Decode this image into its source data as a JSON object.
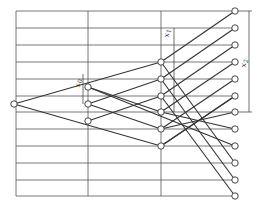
{
  "diagram": {
    "title": "",
    "stroke_color": "#333333",
    "grid_color": "#555555",
    "node_fill": "#ffffff",
    "labels": {
      "x0": "x",
      "x0_sub": "0",
      "x1": "x",
      "x1_sub": "1",
      "x2": "x",
      "x2_sub": "2"
    },
    "grid": {
      "left": 16,
      "top": 11,
      "right": 235,
      "bottom": 196,
      "vertical_lines_x": [
        16,
        88,
        161
      ],
      "horizontal_lines_y": [
        11,
        28,
        45,
        62,
        79,
        96,
        112,
        129,
        146,
        163,
        180,
        196
      ]
    },
    "columns": [
      {
        "name": "column-0",
        "x": 14,
        "nodes_y": [
          104
        ]
      },
      {
        "name": "column-1",
        "x": 88,
        "nodes_y": [
          87,
          104,
          121
        ]
      },
      {
        "name": "column-2",
        "x": 161,
        "nodes_y": [
          62,
          79,
          96,
          112,
          129,
          146
        ]
      },
      {
        "name": "column-3",
        "x": 235,
        "nodes_y": [
          11,
          28,
          45,
          62,
          79,
          96,
          112,
          129,
          146,
          163,
          180,
          196
        ]
      }
    ],
    "edges": [
      [
        [
          14,
          104
        ],
        [
          161,
          62
        ]
      ],
      [
        [
          14,
          104
        ],
        [
          161,
          146
        ]
      ],
      [
        [
          88,
          87
        ],
        [
          161,
          112
        ]
      ],
      [
        [
          88,
          87
        ],
        [
          235,
          146
        ]
      ],
      [
        [
          88,
          104
        ],
        [
          161,
          79
        ]
      ],
      [
        [
          88,
          121
        ],
        [
          161,
          96
        ]
      ],
      [
        [
          88,
          104
        ],
        [
          161,
          129
        ]
      ],
      [
        [
          161,
          62
        ],
        [
          235,
          11
        ]
      ],
      [
        [
          161,
          79
        ],
        [
          235,
          28
        ]
      ],
      [
        [
          161,
          96
        ],
        [
          235,
          45
        ]
      ],
      [
        [
          161,
          112
        ],
        [
          235,
          62
        ]
      ],
      [
        [
          161,
          129
        ],
        [
          235,
          79
        ]
      ],
      [
        [
          161,
          146
        ],
        [
          235,
          96
        ]
      ],
      [
        [
          161,
          62
        ],
        [
          235,
          163
        ]
      ],
      [
        [
          161,
          79
        ],
        [
          235,
          180
        ]
      ],
      [
        [
          161,
          96
        ],
        [
          235,
          196
        ]
      ],
      [
        [
          161,
          112
        ],
        [
          235,
          129
        ]
      ],
      [
        [
          161,
          129
        ],
        [
          235,
          112
        ]
      ],
      [
        [
          161,
          146
        ],
        [
          235,
          96
        ]
      ]
    ],
    "dimensions": {
      "x0": {
        "x": 83,
        "y1": 74,
        "y2": 104
      },
      "x1": {
        "x": 174,
        "y1": 28,
        "y2": 112
      },
      "x2": {
        "x": 249,
        "y1": 11,
        "y2": 112
      }
    }
  }
}
